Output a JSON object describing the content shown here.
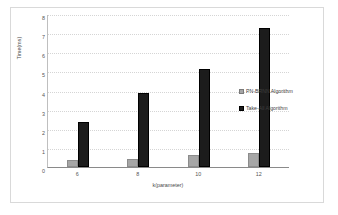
{
  "chart_data": {
    "type": "bar",
    "title": "",
    "categories": [
      "6",
      "8",
      "10",
      "12"
    ],
    "series": [
      {
        "name": "PN-BRNN Algorithm",
        "color": "#a6a6a6",
        "values": [
          0.35,
          0.42,
          0.62,
          0.75
        ]
      },
      {
        "name": "Take-All Algorithm",
        "color": "#1c1c1c",
        "values": [
          2.35,
          3.85,
          5.1,
          7.25
        ]
      }
    ],
    "xlabel": "k(parameter)",
    "ylabel": "Time(ms)",
    "ylim": [
      0,
      8
    ],
    "ytick_labels": [
      "8",
      "7",
      "6",
      "5",
      "4",
      "3",
      "2",
      "1",
      "0"
    ],
    "ytick_step": 1,
    "grid": true,
    "legend_position": "right"
  },
  "legend": {
    "entries": [
      {
        "label": "PN-BRNN Algorithm"
      },
      {
        "label": "Take-All Algorithm"
      }
    ]
  }
}
